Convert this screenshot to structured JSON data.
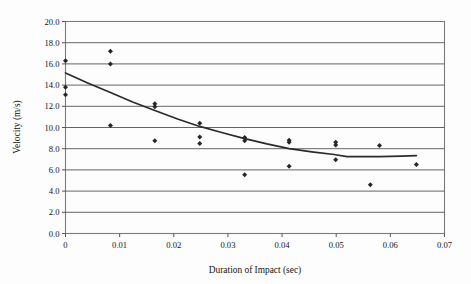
{
  "chart_data": {
    "type": "scatter",
    "title": "",
    "xlabel": "Duration of Impact (sec)",
    "ylabel": "Velocity (m/s)",
    "xlim": [
      0,
      0.07
    ],
    "ylim": [
      0,
      20
    ],
    "xticks": [
      0,
      0.01,
      0.02,
      0.03,
      0.04,
      0.05,
      0.06,
      0.07
    ],
    "xtick_labels": [
      "0",
      "0.01",
      "0.02",
      "0.03",
      "0.04",
      "0.05",
      "0.06",
      "0.07"
    ],
    "yticks": [
      0,
      2,
      4,
      6,
      8,
      10,
      12,
      14,
      16,
      18,
      20
    ],
    "ytick_labels": [
      "0.0",
      "2.0",
      "4.0",
      "6.0",
      "8.0",
      "10.0",
      "12.0",
      "14.0",
      "16.0",
      "18.0",
      "20.0"
    ],
    "grid": "horizontal",
    "legend": "none",
    "marker": "diamond",
    "marker_color": "#262626",
    "trend_color": "#2b2b2b",
    "series": [
      {
        "name": "Measured velocity",
        "type": "scatter",
        "points": [
          {
            "x": 0.0,
            "y": 16.3
          },
          {
            "x": 0.0,
            "y": 13.8
          },
          {
            "x": 0.0,
            "y": 13.1
          },
          {
            "x": 0.0083,
            "y": 17.2
          },
          {
            "x": 0.0083,
            "y": 16.0
          },
          {
            "x": 0.0083,
            "y": 10.2
          },
          {
            "x": 0.0165,
            "y": 12.25
          },
          {
            "x": 0.0165,
            "y": 11.95
          },
          {
            "x": 0.0165,
            "y": 8.75
          },
          {
            "x": 0.0248,
            "y": 10.4
          },
          {
            "x": 0.0248,
            "y": 9.1
          },
          {
            "x": 0.0248,
            "y": 8.5
          },
          {
            "x": 0.0331,
            "y": 9.05
          },
          {
            "x": 0.0331,
            "y": 8.75
          },
          {
            "x": 0.0331,
            "y": 5.55
          },
          {
            "x": 0.0413,
            "y": 8.8
          },
          {
            "x": 0.0413,
            "y": 8.6
          },
          {
            "x": 0.0413,
            "y": 6.35
          },
          {
            "x": 0.0499,
            "y": 8.6
          },
          {
            "x": 0.0499,
            "y": 8.35
          },
          {
            "x": 0.0499,
            "y": 6.95
          },
          {
            "x": 0.0563,
            "y": 4.6
          },
          {
            "x": 0.058,
            "y": 8.3
          },
          {
            "x": 0.0648,
            "y": 6.5
          }
        ]
      },
      {
        "name": "Fitted trend line",
        "type": "line",
        "points": [
          {
            "x": 0.0,
            "y": 15.15
          },
          {
            "x": 0.0041,
            "y": 14.2
          },
          {
            "x": 0.0083,
            "y": 13.3
          },
          {
            "x": 0.0124,
            "y": 12.4
          },
          {
            "x": 0.0165,
            "y": 11.6
          },
          {
            "x": 0.0207,
            "y": 10.8
          },
          {
            "x": 0.0248,
            "y": 10.1
          },
          {
            "x": 0.029,
            "y": 9.5
          },
          {
            "x": 0.0331,
            "y": 8.95
          },
          {
            "x": 0.0372,
            "y": 8.45
          },
          {
            "x": 0.0413,
            "y": 8.0
          },
          {
            "x": 0.0455,
            "y": 7.7
          },
          {
            "x": 0.0496,
            "y": 7.45
          },
          {
            "x": 0.052,
            "y": 7.25
          },
          {
            "x": 0.058,
            "y": 7.25
          },
          {
            "x": 0.062,
            "y": 7.3
          },
          {
            "x": 0.0648,
            "y": 7.35
          }
        ]
      }
    ]
  },
  "axes": {
    "x_title": "Duration of Impact (sec)",
    "y_title": "Velocity (m/s)"
  }
}
